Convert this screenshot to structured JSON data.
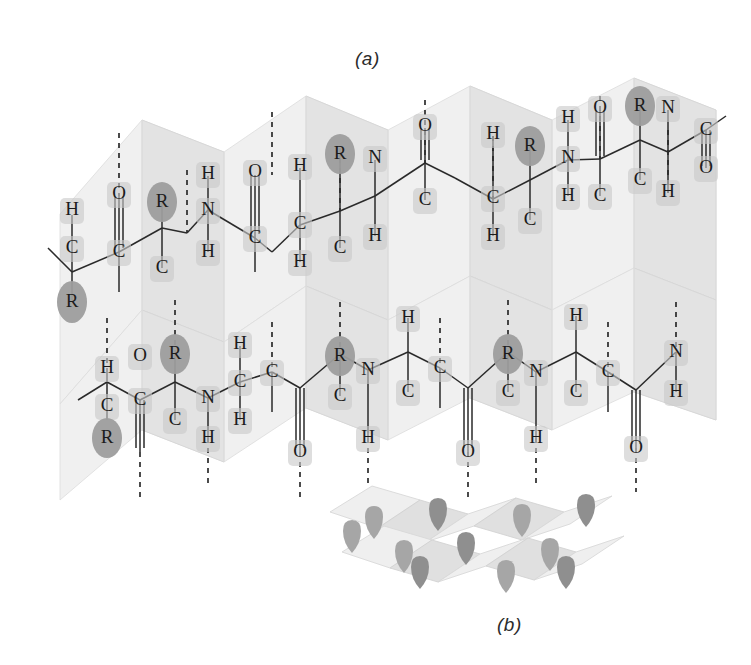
{
  "figure": {
    "panels": [
      {
        "id": "a",
        "label": "(a)",
        "description": "Detailed view of two antiparallel polypeptide chains hydrogen-bonded on a pleated sheet"
      },
      {
        "id": "b",
        "label": "(b)",
        "description": "Simplified accordion-pleated ribbon model with R groups projecting above and below"
      }
    ]
  },
  "atoms": {
    "hydrogen": "H",
    "carbon": "C",
    "nitrogen": "N",
    "oxygen": "O",
    "sidechain": "R"
  },
  "colors": {
    "background": "#ffffff",
    "text": "#1c1c1c",
    "pleat_light": "#f0f0f0",
    "pleat_shade": "#e3e3e3",
    "atom_halo": "#c9c9c9",
    "r_group": "#9d9d9d",
    "bond": "#2a2a2a",
    "hydrogen_bond": "#1e1e1e"
  },
  "chains": {
    "upper": {
      "name": "upper-polypeptide-chain",
      "residues": [
        {
          "ca": "C",
          "h": "H",
          "r": "R",
          "n": "N",
          "nh": "H",
          "co_c": "C",
          "co_o": "O"
        },
        {
          "ca": "C",
          "h": "H",
          "r": "R",
          "n": "N",
          "nh": "H",
          "co_c": "C",
          "co_o": "O"
        },
        {
          "ca": "C",
          "h": "H",
          "r": "R",
          "n": "N",
          "nh": "H",
          "co_c": "C",
          "co_o": "O"
        },
        {
          "ca": "C",
          "h": "H",
          "r": "R",
          "n": "N",
          "nh": "H",
          "co_c": "C",
          "co_o": "O"
        },
        {
          "ca": "C",
          "h": "H",
          "r": "R",
          "n": "N",
          "nh": "H",
          "co_c": "C",
          "co_o": "O"
        },
        {
          "ca": "C",
          "h": "H",
          "r": "R",
          "n": "N",
          "nh": "H",
          "co_c": "C",
          "co_o": "O"
        },
        {
          "ca": "C",
          "h": "H",
          "r": "R",
          "n": "N",
          "nh": "H",
          "co_c": "C",
          "co_o": "O"
        }
      ]
    },
    "lower": {
      "name": "lower-polypeptide-chain",
      "residues": [
        {
          "ca": "C",
          "h": "H",
          "r": "R",
          "n": "N",
          "nh": "H",
          "co_c": "C",
          "co_o": "O"
        },
        {
          "ca": "C",
          "h": "H",
          "r": "R",
          "n": "N",
          "nh": "H",
          "co_c": "C",
          "co_o": "O"
        },
        {
          "ca": "C",
          "h": "H",
          "r": "R",
          "n": "N",
          "nh": "H",
          "co_c": "C",
          "co_o": "O"
        },
        {
          "ca": "C",
          "h": "H",
          "r": "R",
          "n": "N",
          "nh": "H",
          "co_c": "C",
          "co_o": "O"
        },
        {
          "ca": "C",
          "h": "H",
          "r": "R",
          "n": "N",
          "nh": "H",
          "co_c": "C",
          "co_o": "O"
        },
        {
          "ca": "C",
          "h": "H",
          "r": "R",
          "n": "N",
          "nh": "H",
          "co_c": "C",
          "co_o": "O"
        },
        {
          "ca": "C",
          "h": "H",
          "r": "R",
          "n": "N",
          "nh": "H",
          "co_c": "C",
          "co_o": "O"
        }
      ]
    }
  },
  "hydrogen_bonds": {
    "style": "dashed",
    "count": 14,
    "pattern": "C=O···H—N"
  },
  "inset": {
    "pleat_count": 5,
    "r_groups_up": 5,
    "r_groups_down": 5
  }
}
